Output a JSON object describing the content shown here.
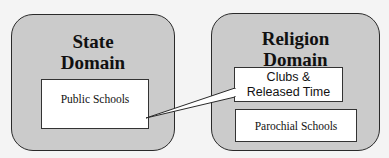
{
  "diagram": {
    "state_domain": {
      "title_line1": "State",
      "title_line2": "Domain",
      "children": [
        {
          "label": "Public Schools"
        }
      ]
    },
    "religion_domain": {
      "title_line1": "Religion",
      "title_line2": "Domain",
      "children": [
        {
          "label_line1": "Clubs &",
          "label_line2": "Released Time"
        },
        {
          "label": "Parochial Schools"
        }
      ]
    },
    "connector": {
      "from": "Public Schools",
      "to": "Clubs & Released Time",
      "style": "callout-wedge"
    },
    "colors": {
      "domain_fill": "#cbcbcb",
      "box_fill": "#ffffff",
      "border": "#2a2a2a",
      "background": "#f4f4f4"
    }
  }
}
